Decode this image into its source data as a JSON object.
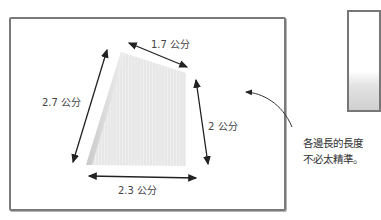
{
  "diagram": {
    "shape": "quadrilateral-paper",
    "measurements": {
      "top": "1.7 公分",
      "left": "2.7 公分",
      "right": "2 公分",
      "bottom": "2.3 公分"
    },
    "note": {
      "line1": "各邊長的長度",
      "line2": "不必太精準。"
    },
    "colors": {
      "frame": "#7a7a7a",
      "arrow": "#222222",
      "paper": "#ececec"
    }
  }
}
